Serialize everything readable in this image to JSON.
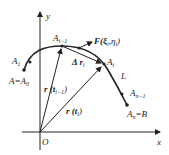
{
  "diagram": {
    "axes": {
      "x_label": "x",
      "y_label": "y",
      "origin_label": "O"
    },
    "curve_label": "L",
    "points": {
      "A1": "A",
      "A1_sub": "1",
      "A_eq_A0": "A=A",
      "A_eq_A0_sub": "0",
      "Ai_minus_1": "A",
      "Ai_minus_1_sub": "i−1",
      "Ai": "A",
      "Ai_sub": "i",
      "An_minus_1": "A",
      "An_minus_1_sub": "n−1",
      "An_eq_B": "A",
      "An_eq_B_sub": "n",
      "An_eq_B_tail": "=B"
    },
    "vectors": {
      "force": "F(ξ",
      "force_sub1": "i",
      "force_mid": ",η",
      "force_sub2": "i",
      "force_end": ")",
      "delta_r": "Δ r",
      "delta_r_sub": "i",
      "r_prev": "r (t",
      "r_prev_sub": "i−1",
      "r_prev_end": ")",
      "r_curr": "r (t",
      "r_curr_sub": "i",
      "r_curr_end": ")"
    },
    "colors": {
      "ink": "#222222",
      "background": "#ffffff"
    }
  }
}
